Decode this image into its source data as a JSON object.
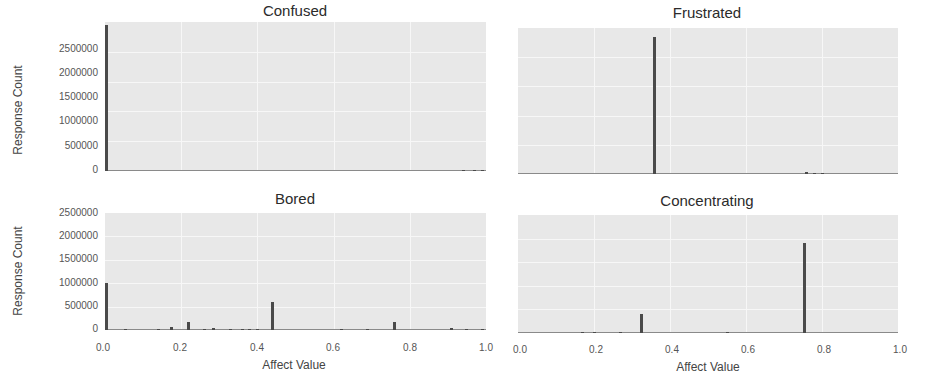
{
  "figure": {
    "ylabel": "Response Count",
    "xlabel": "Affect Value"
  },
  "chart_data": [
    {
      "type": "bar",
      "title": "Confused",
      "xlabel": "",
      "ylabel": "Response Count",
      "xlim": [
        0.0,
        1.0
      ],
      "ylim": [
        0,
        2500000
      ],
      "yticks": [
        "0",
        "500000",
        "1000000",
        "1500000",
        "2000000",
        "2500000"
      ],
      "xticks": [],
      "grid": true,
      "x": [
        0.0,
        0.94,
        0.97,
        0.99
      ],
      "values": [
        2450000,
        8000,
        10000,
        12000
      ]
    },
    {
      "type": "bar",
      "title": "Frustrated",
      "xlabel": "",
      "ylabel": "",
      "xlim": [
        0.0,
        1.0
      ],
      "ylim": [
        0,
        2500000
      ],
      "yticks": [],
      "xticks": [],
      "grid": true,
      "x": [
        0.36,
        0.76,
        0.78,
        0.8
      ],
      "values": [
        2350000,
        40000,
        10000,
        12000
      ]
    },
    {
      "type": "bar",
      "title": "Bored",
      "xlabel": "Affect Value",
      "ylabel": "Response Count",
      "xlim": [
        0.0,
        1.0
      ],
      "ylim": [
        0,
        2500000
      ],
      "yticks": [
        "0",
        "500000",
        "1000000",
        "1500000",
        "2000000",
        "2500000"
      ],
      "xticks": [
        "0.0",
        "0.2",
        "0.4",
        "0.6",
        "0.8",
        "1.0"
      ],
      "grid": true,
      "x": [
        0.0,
        0.055,
        0.14,
        0.175,
        0.22,
        0.26,
        0.285,
        0.33,
        0.36,
        0.38,
        0.4,
        0.44,
        0.62,
        0.69,
        0.76,
        0.91,
        0.95,
        0.99
      ],
      "values": [
        1000000,
        20000,
        15000,
        60000,
        180000,
        15000,
        50000,
        15000,
        20000,
        20000,
        20000,
        600000,
        10000,
        30000,
        170000,
        40000,
        12000,
        10000
      ]
    },
    {
      "type": "bar",
      "title": "Concentrating",
      "xlabel": "Affect Value",
      "ylabel": "",
      "xlim": [
        0.0,
        1.0
      ],
      "ylim": [
        0,
        2500000
      ],
      "yticks": [],
      "xticks": [
        "0.0",
        "0.2",
        "0.4",
        "0.6",
        "0.8",
        "1.0"
      ],
      "grid": true,
      "x": [
        0.17,
        0.2,
        0.27,
        0.325,
        0.55,
        0.755
      ],
      "values": [
        8000,
        10000,
        12000,
        400000,
        10000,
        1900000
      ]
    }
  ]
}
